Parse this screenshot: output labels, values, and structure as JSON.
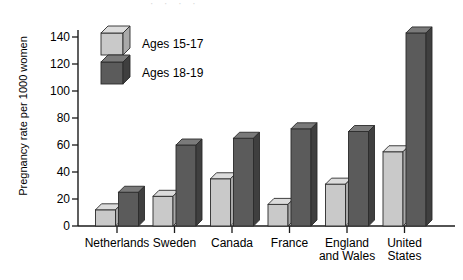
{
  "figure": {
    "page_bleed_text": "· · · ·",
    "axis": {
      "ylabel": "Pregnancy rate per 1000 women",
      "yticks": [
        0,
        20,
        40,
        60,
        80,
        100,
        120,
        140
      ],
      "ylim": [
        0,
        150
      ],
      "grid": false
    },
    "legend": {
      "position": "top-left-inside",
      "entries": [
        {
          "label": "Ages 15-17",
          "color": "#c9c9c9",
          "side_color": "#a9a9a9",
          "top_color": "#dcdcdc"
        },
        {
          "label": "Ages 18-19",
          "color": "#5b5b5b",
          "side_color": "#3f3f3f",
          "top_color": "#7a7a7a"
        }
      ]
    }
  },
  "chart_data": {
    "type": "bar",
    "title": "",
    "xlabel": "",
    "ylabel": "Pregnancy rate per 1000 women",
    "ylim": [
      0,
      150
    ],
    "yticks": [
      0,
      20,
      40,
      60,
      80,
      100,
      120,
      140
    ],
    "grid": false,
    "legend_position": "upper left",
    "categories": [
      "Netherlands",
      "Sweden",
      "Canada",
      "France",
      "England\nand Wales",
      "United\nStates"
    ],
    "series": [
      {
        "name": "Ages 15-17",
        "color": "#c9c9c9",
        "values": [
          12,
          22,
          35,
          16,
          31,
          55
        ]
      },
      {
        "name": "Ages 18-19",
        "color": "#5b5b5b",
        "values": [
          25,
          60,
          65,
          72,
          70,
          143
        ]
      }
    ]
  }
}
